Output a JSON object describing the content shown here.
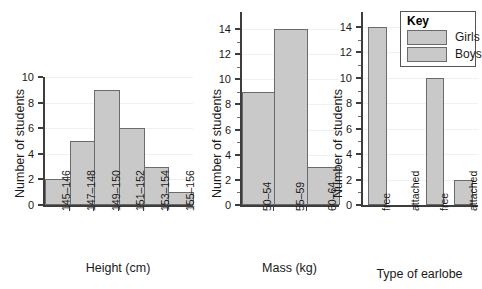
{
  "chart_data": [
    {
      "type": "bar",
      "id": "height-histogram",
      "title": "",
      "xlabel": "Height (cm)",
      "ylabel": "Number of students",
      "categories": [
        "145–146",
        "147–148",
        "149–150",
        "151–152",
        "153–154",
        "155–156"
      ],
      "values": [
        2,
        5,
        9,
        6,
        3,
        1
      ],
      "ylim": [
        0,
        10
      ],
      "ytick_step": 2,
      "yticks": [
        0,
        2,
        4,
        6,
        8,
        10
      ],
      "grid": true,
      "legend": null,
      "contiguous_bars": true
    },
    {
      "type": "bar",
      "id": "mass-histogram",
      "title": "",
      "xlabel": "Mass (kg)",
      "ylabel": "Number of students",
      "categories": [
        "50–54",
        "55–59",
        "60–64"
      ],
      "values": [
        9,
        14,
        3
      ],
      "ylim": [
        0,
        14
      ],
      "ytick_step": 2,
      "yticks": [
        0,
        2,
        4,
        6,
        8,
        10,
        12,
        14
      ],
      "grid": true,
      "legend": null,
      "contiguous_bars": true
    },
    {
      "type": "bar",
      "id": "earlobe-bar-chart",
      "title": "",
      "xlabel": "Type of earlobe",
      "ylabel": "Number of students",
      "categories": [
        "free",
        "attached",
        "free",
        "attached"
      ],
      "values": [
        14,
        0,
        10,
        2
      ],
      "series": [
        {
          "name": "Girls",
          "categories": [
            "free",
            "attached"
          ],
          "values": [
            14,
            0
          ]
        },
        {
          "name": "Boys",
          "categories": [
            "free",
            "attached"
          ],
          "values": [
            10,
            2
          ]
        }
      ],
      "ylim": [
        0,
        14
      ],
      "ytick_step": 2,
      "yticks": [
        0,
        2,
        4,
        6,
        8,
        10,
        12,
        14
      ],
      "grid": true,
      "legend": {
        "title": "Key",
        "position": "top-right",
        "entries": [
          {
            "label": "Girls",
            "color": "#c9c9c9"
          },
          {
            "label": "Boys",
            "color": "#c9c9c9"
          }
        ]
      },
      "contiguous_bars": false
    }
  ],
  "charts": {
    "height": {
      "ylabel": "Number of students",
      "xlabel": "Height (cm)",
      "yticks": [
        "0",
        "2",
        "4",
        "6",
        "8",
        "10"
      ],
      "xticks": [
        "145–146",
        "147–148",
        "149–150",
        "151–152",
        "153–154",
        "155–156"
      ]
    },
    "mass": {
      "ylabel": "Number of students",
      "xlabel": "Mass (kg)",
      "yticks": [
        "0",
        "2",
        "4",
        "6",
        "8",
        "10",
        "12",
        "14"
      ],
      "xticks": [
        "50–54",
        "55–59",
        "60–64"
      ]
    },
    "earlobe": {
      "ylabel": "Number of students",
      "xlabel": "Type of earlobe",
      "yticks": [
        "0",
        "2",
        "4",
        "6",
        "8",
        "10",
        "12",
        "14"
      ],
      "xticks": [
        "free",
        "attached",
        "free",
        "attached"
      ],
      "key": {
        "title": "Key",
        "girls": "Girls",
        "boys": "Boys"
      }
    }
  },
  "colors": {
    "bar_fill": "#c9c9c9",
    "bar_stroke": "#6b6b6b",
    "axis": "#3d3d3d",
    "grid": "#f0f0f0",
    "text": "#1a1a1a",
    "background": "#ffffff"
  }
}
